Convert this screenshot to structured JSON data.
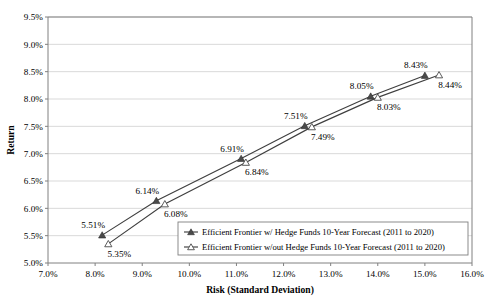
{
  "chart_data": {
    "type": "line",
    "title": "",
    "xlabel": "Risk (Standard Deviation)",
    "ylabel": "Return",
    "xlim": [
      7.0,
      16.0
    ],
    "ylim": [
      5.0,
      9.5
    ],
    "xticks": [
      "7.0%",
      "8.0%",
      "9.0%",
      "10.0%",
      "11.0%",
      "12.0%",
      "13.0%",
      "14.0%",
      "15.0%",
      "16.0%"
    ],
    "yticks": [
      "5.0%",
      "5.5%",
      "6.0%",
      "6.5%",
      "7.0%",
      "7.5%",
      "8.0%",
      "8.5%",
      "9.0%",
      "9.5%"
    ],
    "xtick_values": [
      7.0,
      8.0,
      9.0,
      10.0,
      11.0,
      12.0,
      13.0,
      14.0,
      15.0,
      16.0
    ],
    "ytick_values": [
      5.0,
      5.5,
      6.0,
      6.5,
      7.0,
      7.5,
      8.0,
      8.5,
      9.0,
      9.5
    ],
    "grid": "horizontal",
    "legend_position": "bottom-right-inside",
    "series": [
      {
        "name": "Efficient Frontier w/ Hedge Funds 10-Year Forecast (2011 to 2020)",
        "marker": "filled-triangle",
        "x": [
          8.15,
          9.3,
          11.1,
          12.45,
          13.85,
          15.0
        ],
        "y": [
          5.51,
          6.14,
          6.91,
          7.51,
          8.05,
          8.43
        ],
        "labels": [
          "5.51%",
          "6.14%",
          "6.91%",
          "7.51%",
          "8.05%",
          "8.43%"
        ],
        "label_positions": [
          "above-left",
          "above-left",
          "above-left",
          "above-left",
          "above-left",
          "above-left"
        ]
      },
      {
        "name": "Efficient Frontier w/out Hedge Funds 10-Year Forecast (2011 to 2020)",
        "marker": "open-triangle",
        "x": [
          8.28,
          9.48,
          11.2,
          12.6,
          14.0,
          15.3
        ],
        "y": [
          5.35,
          6.08,
          6.84,
          7.49,
          8.03,
          8.44
        ],
        "labels": [
          "5.35%",
          "6.08%",
          "6.84%",
          "7.49%",
          "8.03%",
          "8.44%"
        ],
        "label_positions": [
          "below-right",
          "below-right",
          "below-right",
          "below-right",
          "below-right",
          "below-right"
        ]
      }
    ]
  },
  "legend": {
    "entries": [
      "Efficient Frontier w/ Hedge Funds 10-Year Forecast (2011 to 2020)",
      "Efficient Frontier w/out Hedge Funds 10-Year Forecast (2011 to 2020)"
    ]
  },
  "colors": {
    "series_line": "#3f3f3f",
    "marker_filled": "#4a4a4a",
    "marker_open": "#ffffff",
    "grid": "#d9d9d9",
    "axis": "#808080",
    "background": "#ffffff"
  }
}
